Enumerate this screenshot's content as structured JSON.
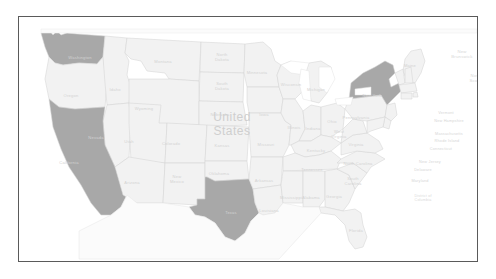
{
  "map": {
    "title": "United States",
    "center_label": "United States",
    "frame_color": "#5a5a5a",
    "background_color": "#ffffff",
    "highlight_color": "#a8a8a8",
    "base_state_color": "#f2f2f2",
    "border_color": "#d8d8d8",
    "label_color": "#d2d2d2",
    "water_color": "#ffffff",
    "highlighted_states": [
      "Washington",
      "California",
      "Texas",
      "New York"
    ],
    "country_labels": [
      {
        "name": "Mexico",
        "x": 215,
        "y": 256
      },
      {
        "name": "United States",
        "x": 213,
        "y": 108
      }
    ],
    "province_labels": [
      {
        "name": "New Brunswick",
        "line1": "New",
        "line2": "Brunswick",
        "x": 443,
        "y": 38
      },
      {
        "name": "Nova Scotia",
        "line1": "Nova",
        "line2": "Scotia",
        "x": 457,
        "y": 62
      }
    ],
    "state_labels": [
      {
        "name": "Washington",
        "x": 61,
        "y": 40,
        "lines": [
          "Washington"
        ]
      },
      {
        "name": "Oregon",
        "x": 52,
        "y": 78,
        "lines": [
          "Oregon"
        ]
      },
      {
        "name": "Idaho",
        "x": 96,
        "y": 72,
        "lines": [
          "Idaho"
        ]
      },
      {
        "name": "Montana",
        "x": 144,
        "y": 44,
        "lines": [
          "Montana"
        ]
      },
      {
        "name": "North Dakota",
        "x": 203,
        "y": 41,
        "lines": [
          "North",
          "Dakota"
        ]
      },
      {
        "name": "South Dakota",
        "x": 203,
        "y": 70,
        "lines": [
          "South",
          "Dakota"
        ]
      },
      {
        "name": "Wyoming",
        "x": 125,
        "y": 91,
        "lines": [
          "Wyoming"
        ]
      },
      {
        "name": "Nebraska",
        "x": 201,
        "y": 97,
        "lines": [
          "Nebraska"
        ]
      },
      {
        "name": "Nevada",
        "x": 77,
        "y": 120,
        "lines": [
          "Nevada"
        ]
      },
      {
        "name": "Utah",
        "x": 110,
        "y": 124,
        "lines": [
          "Utah"
        ]
      },
      {
        "name": "Colorado",
        "x": 152,
        "y": 126,
        "lines": [
          "Colorado"
        ]
      },
      {
        "name": "Kansas",
        "x": 203,
        "y": 128,
        "lines": [
          "Kansas"
        ]
      },
      {
        "name": "California",
        "x": 50,
        "y": 145,
        "lines": [
          "California"
        ]
      },
      {
        "name": "Arizona",
        "x": 113,
        "y": 165,
        "lines": [
          "Arizona"
        ]
      },
      {
        "name": "New Mexico",
        "x": 158,
        "y": 163,
        "lines": [
          "New",
          "Mexico"
        ]
      },
      {
        "name": "Oklahoma",
        "x": 200,
        "y": 156,
        "lines": [
          "Oklahoma"
        ]
      },
      {
        "name": "Texas",
        "x": 212,
        "y": 195,
        "lines": [
          "Texas"
        ]
      },
      {
        "name": "Minnesota",
        "x": 238,
        "y": 55,
        "lines": [
          "Minnesota"
        ]
      },
      {
        "name": "Iowa",
        "x": 245,
        "y": 97,
        "lines": [
          "Iowa"
        ]
      },
      {
        "name": "Missouri",
        "x": 247,
        "y": 127,
        "lines": [
          "Missouri"
        ]
      },
      {
        "name": "Arkansas",
        "x": 245,
        "y": 163,
        "lines": [
          "Arkansas"
        ]
      },
      {
        "name": "Louisiana",
        "x": 250,
        "y": 193,
        "lines": [
          "Louisiana"
        ]
      },
      {
        "name": "Wisconsin",
        "x": 272,
        "y": 67,
        "lines": [
          "Wisconsin"
        ]
      },
      {
        "name": "Illinois",
        "x": 275,
        "y": 110,
        "lines": [
          "Illinois"
        ]
      },
      {
        "name": "Michigan",
        "x": 297,
        "y": 72,
        "lines": [
          "Michigan"
        ]
      },
      {
        "name": "Indiana",
        "x": 294,
        "y": 111,
        "lines": [
          "Indiana"
        ]
      },
      {
        "name": "Ohio",
        "x": 313,
        "y": 104,
        "lines": [
          "Ohio"
        ]
      },
      {
        "name": "Kentucky",
        "x": 297,
        "y": 133,
        "lines": [
          "Kentucky"
        ]
      },
      {
        "name": "Tennessee",
        "x": 293,
        "y": 152,
        "lines": [
          "Tennessee"
        ]
      },
      {
        "name": "Mississippi",
        "x": 272,
        "y": 180,
        "lines": [
          "Mississippi"
        ]
      },
      {
        "name": "Alabama",
        "x": 292,
        "y": 180,
        "lines": [
          "Alabama"
        ]
      },
      {
        "name": "Georgia",
        "x": 315,
        "y": 179,
        "lines": [
          "Georgia"
        ]
      },
      {
        "name": "Florida",
        "x": 337,
        "y": 213,
        "lines": [
          "Florida"
        ]
      },
      {
        "name": "South Carolina",
        "x": 334,
        "y": 165,
        "lines": [
          "South",
          "Carolina"
        ]
      },
      {
        "name": "North Carolina",
        "x": 339,
        "y": 146,
        "lines": [
          "North Carolina"
        ]
      },
      {
        "name": "Virginia",
        "x": 337,
        "y": 127,
        "lines": [
          "Virginia"
        ]
      },
      {
        "name": "West Virginia",
        "x": 320,
        "y": 118,
        "lines": [
          "West",
          "Virginia"
        ]
      },
      {
        "name": "Pennsylvania",
        "x": 337,
        "y": 100,
        "lines": [
          "Pennsylvania"
        ]
      },
      {
        "name": "New York",
        "x": 353,
        "y": 78,
        "lines": [
          "New York"
        ]
      },
      {
        "name": "Maine",
        "x": 391,
        "y": 48,
        "lines": [
          "Maine"
        ]
      }
    ],
    "side_labels": [
      {
        "name": "Vermont",
        "x": 427,
        "y": 96
      },
      {
        "name": "New Hampshire",
        "x": 430,
        "y": 104
      },
      {
        "name": "Massachusetts",
        "x": 430,
        "y": 117
      },
      {
        "name": "Rhode Island",
        "x": 428,
        "y": 124
      },
      {
        "name": "Connecticut",
        "x": 422,
        "y": 132
      },
      {
        "name": "New Jersey",
        "x": 411,
        "y": 145
      },
      {
        "name": "Delaware",
        "x": 404,
        "y": 153
      },
      {
        "name": "Maryland",
        "x": 401,
        "y": 164
      },
      {
        "name": "District of Columbia",
        "x": 404,
        "y": 181
      }
    ]
  }
}
